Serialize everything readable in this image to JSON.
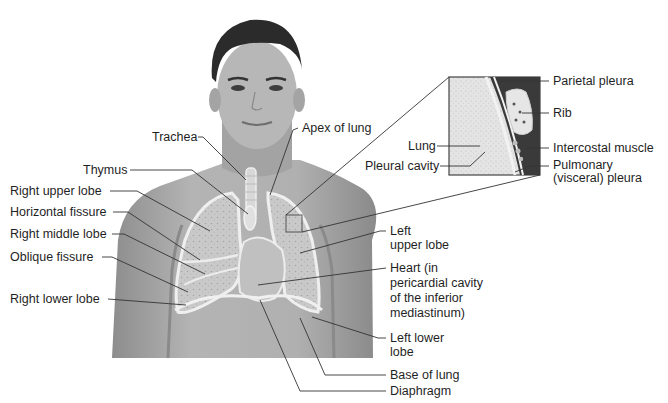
{
  "diagram": {
    "title_visible": false,
    "colors": {
      "background": "#ffffff",
      "skin": "#a9a9a9",
      "skin_dark": "#7d7d7d",
      "hair": "#2a2a2a",
      "lung_fill": "#cfcfcf",
      "lung_outline": "#eeeeee",
      "leader_line": "#333333",
      "text": "#1f1f1f"
    },
    "labels_left": [
      {
        "id": "trachea",
        "text": "Trachea",
        "x": 152,
        "y": 137
      },
      {
        "id": "thymus",
        "text": "Thymus",
        "x": 83,
        "y": 170
      },
      {
        "id": "right-upper-lobe",
        "text": "Right upper lobe",
        "x": 10,
        "y": 191
      },
      {
        "id": "horizontal-fissure",
        "text": "Horizontal fissure",
        "x": 10,
        "y": 212
      },
      {
        "id": "right-middle-lobe",
        "text": "Right middle lobe",
        "x": 10,
        "y": 234
      },
      {
        "id": "oblique-fissure",
        "text": "Oblique fissure",
        "x": 10,
        "y": 257
      },
      {
        "id": "right-lower-lobe",
        "text": "Right lower lobe",
        "x": 10,
        "y": 293
      }
    ],
    "labels_right": [
      {
        "id": "apex-of-lung",
        "text": "Apex of lung",
        "x": 302,
        "y": 124
      },
      {
        "id": "left-upper-lobe",
        "text": "Left\nupper lobe",
        "x": 390,
        "y": 226
      },
      {
        "id": "heart",
        "text": "Heart (in\npericardial cavity\nof the inferior\nmediastinum)",
        "x": 390,
        "y": 263
      },
      {
        "id": "left-lower-lobe",
        "text": "Left lower\nlobe",
        "x": 390,
        "y": 329
      },
      {
        "id": "base-of-lung",
        "text": "Base of lung",
        "x": 390,
        "y": 369
      },
      {
        "id": "diaphragm",
        "text": "Diaphragm",
        "x": 390,
        "y": 385
      }
    ],
    "inset": {
      "box": {
        "x": 449,
        "y": 77,
        "w": 91,
        "h": 98
      },
      "labels_left": [
        {
          "id": "inset-lung",
          "text": "Lung",
          "x": 411,
          "y": 140
        },
        {
          "id": "pleural-cavity",
          "text": "Pleural cavity",
          "x": 365,
          "y": 160
        }
      ],
      "labels_right": [
        {
          "id": "parietal-pleura",
          "text": "Parietal pleura",
          "x": 553,
          "y": 75
        },
        {
          "id": "rib",
          "text": "Rib",
          "x": 553,
          "y": 107
        },
        {
          "id": "intercostal-muscle",
          "text": "Intercostal muscle",
          "x": 553,
          "y": 142
        },
        {
          "id": "pulmonary-pleura",
          "text": "Pulmonary\n(visceral) pleura",
          "x": 553,
          "y": 160
        }
      ]
    }
  }
}
